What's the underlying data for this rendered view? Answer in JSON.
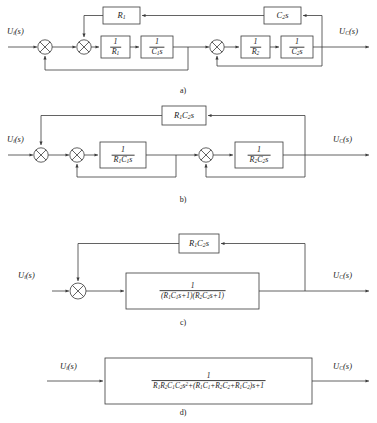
{
  "figure": {
    "type": "control-system-block-diagram",
    "line_color": "#3b3b3b",
    "background_color": "#ffffff"
  },
  "io_labels": {
    "input": "Uᵢ(s)",
    "output": "U_C(s)"
  },
  "panels": [
    {
      "id": "a",
      "caption": "a)",
      "input_label": "Uᵢ(s)",
      "output_label": "U_C(s)",
      "summing_junctions": 4,
      "blocks": [
        {
          "name": "feedback-r1",
          "label": "R₁",
          "kind": "plain"
        },
        {
          "name": "feedback-c2s",
          "label": "C₂s",
          "kind": "plain"
        },
        {
          "name": "forward-inv-r1",
          "numerator": "1",
          "denominator": "R₁",
          "kind": "fraction"
        },
        {
          "name": "forward-inv-c1s",
          "numerator": "1",
          "denominator": "C₁s",
          "kind": "fraction"
        },
        {
          "name": "forward-inv-r2",
          "numerator": "1",
          "denominator": "R₂",
          "kind": "fraction"
        },
        {
          "name": "forward-inv-c2s",
          "numerator": "1",
          "denominator": "C₂s",
          "kind": "fraction"
        }
      ]
    },
    {
      "id": "b",
      "caption": "b)",
      "input_label": "Uᵢ(s)",
      "output_label": "U_C(s)",
      "summing_junctions": 4,
      "blocks": [
        {
          "name": "feedback-r1c2s",
          "label": "R₁C₂s",
          "kind": "plain"
        },
        {
          "name": "forward-stage1",
          "numerator": "1",
          "denominator": "R₁C₁s",
          "kind": "fraction"
        },
        {
          "name": "forward-stage2",
          "numerator": "1",
          "denominator": "R₂C₂s",
          "kind": "fraction"
        }
      ]
    },
    {
      "id": "c",
      "caption": "c)",
      "input_label": "Uᵢ(s)",
      "output_label": "U_C(s)",
      "summing_junctions": 1,
      "blocks": [
        {
          "name": "feedback-r1c2s",
          "label": "R₁C₂s",
          "kind": "plain"
        },
        {
          "name": "forward-combined",
          "numerator": "1",
          "denominator": "(R₁C₁s+1)(R₂C₂s+1)",
          "kind": "fraction"
        }
      ]
    },
    {
      "id": "d",
      "caption": "d)",
      "input_label": "Uᵢ(s)",
      "output_label": "U_C(s)",
      "summing_junctions": 0,
      "blocks": [
        {
          "name": "closed-loop-transfer-function",
          "numerator": "1",
          "denominator": "R₁R₂C₁C₂s²+(R₁C₁+R₂C₂+R₁C₂)s+1",
          "kind": "fraction"
        }
      ]
    }
  ],
  "equations": {
    "panel_c_denominator_parts": [
      "(R₁C₁s+1)",
      "(R₂C₂s+1)"
    ],
    "panel_d_denominator_terms": [
      "R₁R₂C₁C₂s²",
      "(R₁C₁+R₂C₂+R₁C₂)s",
      "1"
    ]
  }
}
